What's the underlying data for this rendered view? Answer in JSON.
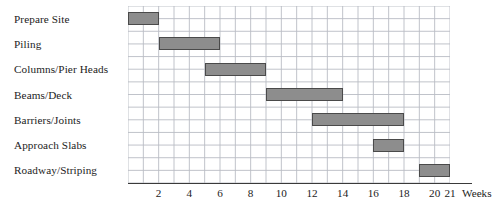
{
  "chart_data": {
    "type": "bar",
    "chart_kind": "gantt",
    "title": "",
    "xlabel": "Weeks",
    "ylabel": "",
    "xlim": [
      0,
      21
    ],
    "grid": true,
    "legend": "none",
    "grid_columns": 21,
    "grid_rows": 14,
    "categories": [
      "Prepare Site",
      "Piling",
      "Columns/Pier Heads",
      "Beams/Deck",
      "Barriers/Joints",
      "Approach Slabs",
      "Roadway/Striping"
    ],
    "tasks": [
      {
        "name": "Prepare Site",
        "start": 0,
        "end": 2,
        "duration": 2
      },
      {
        "name": "Piling",
        "start": 2,
        "end": 6,
        "duration": 4
      },
      {
        "name": "Columns/Pier Heads",
        "start": 5,
        "end": 9,
        "duration": 4
      },
      {
        "name": "Beams/Deck",
        "start": 9,
        "end": 14,
        "duration": 5
      },
      {
        "name": "Barriers/Joints",
        "start": 12,
        "end": 18,
        "duration": 6
      },
      {
        "name": "Approach Slabs",
        "start": 16,
        "end": 18,
        "duration": 2
      },
      {
        "name": "Roadway/Striping",
        "start": 19,
        "end": 21,
        "duration": 2
      }
    ],
    "x_ticks": [
      {
        "value": 2,
        "label": "2"
      },
      {
        "value": 4,
        "label": "4"
      },
      {
        "value": 6,
        "label": "6"
      },
      {
        "value": 8,
        "label": "8"
      },
      {
        "value": 10,
        "label": "10"
      },
      {
        "value": 12,
        "label": "12"
      },
      {
        "value": 14,
        "label": "14"
      },
      {
        "value": 16,
        "label": "16"
      },
      {
        "value": 18,
        "label": "18"
      },
      {
        "value": 20,
        "label": "20"
      },
      {
        "value": 21,
        "label": "21"
      }
    ],
    "axis_unit_label": "Weeks",
    "colors": {
      "bar_fill": "#8d8d8d",
      "bar_border": "#4a4a4a",
      "grid_line": "#b9bcc4",
      "axis_line": "#3a3a3a",
      "text": "#1c1c1c",
      "background": "#ffffff"
    }
  }
}
